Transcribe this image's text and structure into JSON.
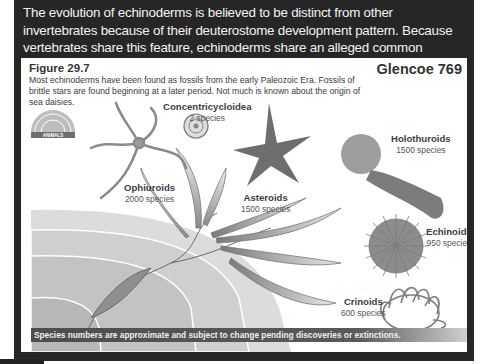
{
  "intro": {
    "text": "The evolution of echinoderms is believed to be distinct from other invertebrates because of their deuterostome development pattern. Because vertebrates share this feature, echinoderms share an alleged common ancestor with vertebrates."
  },
  "figure": {
    "label": "Figure 29.7",
    "caption": "Most echinoderms have been found as fossils from the early Paleozoic Era. Fossils of brittle stars are found beginning at a later period. Not much is known about the origin of sea daisies.",
    "source": "Glencoe 769",
    "logo_label": "ANIMALS",
    "taxa": [
      {
        "name": "Concentricycloidea",
        "count": "2 species"
      },
      {
        "name": "Ophiuroids",
        "count": "2000 species"
      },
      {
        "name": "Asteroids",
        "count": "1500 species"
      },
      {
        "name": "Holothuroids",
        "count": "1500 species"
      },
      {
        "name": "Echinoids",
        "count": "950 species"
      },
      {
        "name": "Crinoids",
        "count": "600 species"
      }
    ],
    "footnote": "Species numbers are approximate and subject to change pending discoveries or extinctions."
  }
}
